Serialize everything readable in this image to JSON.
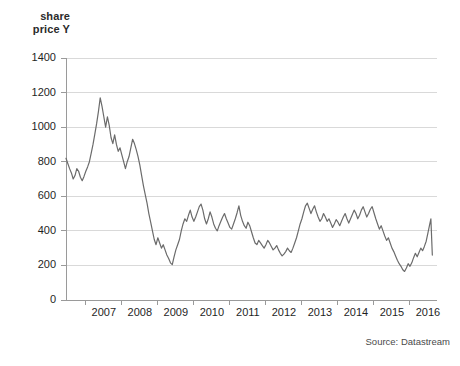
{
  "axis_title_lines": [
    "share",
    "price Y"
  ],
  "source": "Source: Datastream",
  "colors": {
    "line": "#6b6b6b",
    "grid": "#d9d9d9",
    "axis": "#9a9a9a",
    "text": "#1f1f1f",
    "title_text": "#2b2b2b",
    "source_text": "#4a4a4a",
    "background": "#ffffff"
  },
  "chart_data": {
    "type": "line",
    "title": "",
    "subtitle": "",
    "xlabel": "",
    "ylabel": "share price Y",
    "ylim": [
      0,
      1400
    ],
    "yticks": [
      0,
      200,
      400,
      600,
      800,
      1000,
      1200,
      1400
    ],
    "xlim": [
      2006.45,
      2016.75
    ],
    "xticks": [
      2007,
      2008,
      2009,
      2010,
      2011,
      2012,
      2013,
      2014,
      2015,
      2016
    ],
    "xtick_labels": [
      "2007",
      "2008",
      "2009",
      "2010",
      "2011",
      "2012",
      "2013",
      "2014",
      "2015",
      "2016"
    ],
    "grid": "horizontal",
    "legend": "none",
    "annotations": [
      "Source: Datastream"
    ],
    "series": [
      {
        "name": "share price Y",
        "x": [
          2006.45,
          2006.5,
          2006.55,
          2006.6,
          2006.65,
          2006.7,
          2006.75,
          2006.8,
          2006.85,
          2006.9,
          2006.95,
          2007.0,
          2007.05,
          2007.1,
          2007.15,
          2007.2,
          2007.25,
          2007.3,
          2007.35,
          2007.4,
          2007.45,
          2007.5,
          2007.55,
          2007.6,
          2007.65,
          2007.7,
          2007.75,
          2007.8,
          2007.85,
          2007.9,
          2007.95,
          2008.0,
          2008.05,
          2008.1,
          2008.15,
          2008.2,
          2008.25,
          2008.3,
          2008.35,
          2008.4,
          2008.45,
          2008.5,
          2008.55,
          2008.6,
          2008.65,
          2008.7,
          2008.75,
          2008.8,
          2008.85,
          2008.9,
          2008.95,
          2009.0,
          2009.05,
          2009.1,
          2009.15,
          2009.2,
          2009.25,
          2009.3,
          2009.35,
          2009.4,
          2009.45,
          2009.5,
          2009.55,
          2009.6,
          2009.65,
          2009.7,
          2009.75,
          2009.8,
          2009.85,
          2009.9,
          2009.95,
          2010.0,
          2010.05,
          2010.1,
          2010.15,
          2010.2,
          2010.25,
          2010.3,
          2010.35,
          2010.4,
          2010.45,
          2010.5,
          2010.55,
          2010.6,
          2010.65,
          2010.7,
          2010.75,
          2010.8,
          2010.85,
          2010.9,
          2010.95,
          2011.0,
          2011.05,
          2011.1,
          2011.15,
          2011.2,
          2011.25,
          2011.3,
          2011.35,
          2011.4,
          2011.45,
          2011.5,
          2011.55,
          2011.6,
          2011.65,
          2011.7,
          2011.75,
          2011.8,
          2011.85,
          2011.9,
          2011.95,
          2012.0,
          2012.05,
          2012.1,
          2012.15,
          2012.2,
          2012.25,
          2012.3,
          2012.35,
          2012.4,
          2012.45,
          2012.5,
          2012.55,
          2012.6,
          2012.65,
          2012.7,
          2012.75,
          2012.8,
          2012.85,
          2012.9,
          2012.95,
          2013.0,
          2013.05,
          2013.1,
          2013.15,
          2013.2,
          2013.25,
          2013.3,
          2013.35,
          2013.4,
          2013.45,
          2013.5,
          2013.55,
          2013.6,
          2013.65,
          2013.7,
          2013.75,
          2013.8,
          2013.85,
          2013.9,
          2013.95,
          2014.0,
          2014.05,
          2014.1,
          2014.15,
          2014.2,
          2014.25,
          2014.3,
          2014.35,
          2014.4,
          2014.45,
          2014.5,
          2014.55,
          2014.6,
          2014.65,
          2014.7,
          2014.75,
          2014.8,
          2014.85,
          2014.9,
          2014.95,
          2015.0,
          2015.05,
          2015.1,
          2015.15,
          2015.2,
          2015.25,
          2015.3,
          2015.35,
          2015.4,
          2015.45,
          2015.5,
          2015.55,
          2015.6,
          2015.65,
          2015.7,
          2015.75,
          2015.8,
          2015.85,
          2015.9,
          2015.95,
          2016.0,
          2016.05,
          2016.1,
          2016.15,
          2016.2,
          2016.25,
          2016.3,
          2016.35,
          2016.4,
          2016.45,
          2016.5,
          2016.55,
          2016.58,
          2016.62
        ],
        "values": [
          820,
          790,
          760,
          735,
          700,
          720,
          760,
          745,
          710,
          690,
          715,
          745,
          770,
          800,
          850,
          900,
          960,
          1020,
          1090,
          1170,
          1120,
          1060,
          1000,
          1060,
          1010,
          940,
          905,
          955,
          900,
          860,
          880,
          840,
          800,
          760,
          800,
          830,
          880,
          930,
          905,
          870,
          830,
          780,
          720,
          660,
          610,
          560,
          500,
          450,
          400,
          350,
          320,
          360,
          330,
          300,
          320,
          290,
          260,
          240,
          215,
          205,
          250,
          290,
          320,
          350,
          400,
          440,
          470,
          455,
          490,
          520,
          480,
          455,
          480,
          510,
          540,
          555,
          520,
          470,
          440,
          470,
          510,
          480,
          440,
          415,
          400,
          430,
          455,
          480,
          500,
          470,
          445,
          420,
          410,
          440,
          470,
          505,
          545,
          490,
          455,
          430,
          415,
          450,
          430,
          395,
          360,
          330,
          320,
          345,
          330,
          315,
          300,
          320,
          345,
          330,
          310,
          290,
          300,
          315,
          290,
          270,
          255,
          265,
          280,
          300,
          285,
          275,
          300,
          330,
          360,
          400,
          440,
          470,
          510,
          545,
          560,
          530,
          500,
          525,
          545,
          510,
          480,
          455,
          470,
          500,
          480,
          455,
          470,
          445,
          420,
          440,
          465,
          450,
          430,
          455,
          480,
          500,
          470,
          445,
          470,
          495,
          520,
          500,
          470,
          490,
          520,
          540,
          510,
          480,
          500,
          525,
          540,
          505,
          470,
          440,
          410,
          430,
          400,
          370,
          345,
          360,
          330,
          300,
          280,
          255,
          230,
          210,
          195,
          175,
          165,
          185,
          210,
          195,
          215,
          245,
          270,
          250,
          275,
          300,
          285,
          310,
          340,
          390,
          440,
          470,
          260
        ]
      }
    ]
  }
}
